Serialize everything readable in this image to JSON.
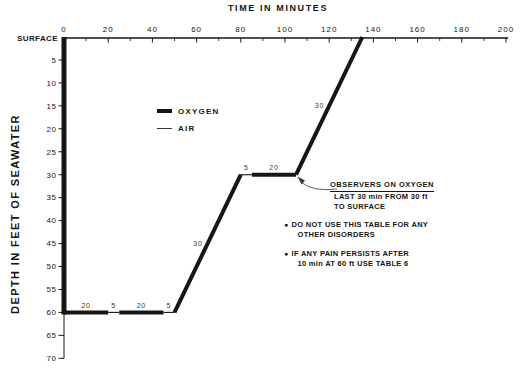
{
  "page": {
    "background": "#ffffff",
    "ink": "#161616",
    "muted_ink": "#3a3a3a"
  },
  "title": "TIME IN MINUTES",
  "y_axis_label": "DEPTH IN FEET OF SEAWATER",
  "legend": {
    "items": [
      {
        "label": "OXYGEN",
        "style": "oxygen"
      },
      {
        "label": "AIR",
        "style": "air"
      }
    ]
  },
  "callout": {
    "title": "OBSERVERS ON OXYGEN",
    "lines": [
      "LAST 30 min FROM 30 ft",
      "TO SURFACE"
    ]
  },
  "notes": {
    "bullet": "●",
    "items": [
      {
        "lines": [
          "DO NOT USE THIS TABLE FOR ANY",
          "OTHER DISORDERS"
        ]
      },
      {
        "lines": [
          "IF ANY PAIN PERSISTS AFTER",
          "10 min AT 60 ft USE TABLE 6"
        ]
      }
    ]
  },
  "chart_data": {
    "type": "line",
    "title": "TIME IN MINUTES",
    "xlabel": "TIME IN MINUTES",
    "ylabel": "DEPTH IN FEET OF SEAWATER",
    "xlim": [
      0,
      200
    ],
    "ylim": [
      0,
      70
    ],
    "y_axis_inverted": true,
    "grid": false,
    "legend_position": "upper-left-inside",
    "x_ticks": [
      0,
      20,
      40,
      60,
      80,
      100,
      120,
      140,
      160,
      180,
      200
    ],
    "x_minor_ticks": [
      10,
      30,
      50,
      70,
      90,
      110,
      130,
      150,
      170,
      190
    ],
    "y_ticks": [
      5,
      10,
      15,
      20,
      25,
      30,
      35,
      40,
      45,
      50,
      55,
      60,
      65,
      70
    ],
    "surface_label": "SURFACE",
    "series_names": [
      "OXYGEN",
      "AIR"
    ],
    "segments": [
      {
        "t0": 0,
        "d0": 0,
        "t1": 0,
        "d1": 60,
        "gas": "oxygen",
        "label": ""
      },
      {
        "t0": 0,
        "d0": 60,
        "t1": 20,
        "d1": 60,
        "gas": "oxygen",
        "label": "20"
      },
      {
        "t0": 20,
        "d0": 60,
        "t1": 25,
        "d1": 60,
        "gas": "air",
        "label": "5"
      },
      {
        "t0": 25,
        "d0": 60,
        "t1": 45,
        "d1": 60,
        "gas": "oxygen",
        "label": "20"
      },
      {
        "t0": 45,
        "d0": 60,
        "t1": 50,
        "d1": 60,
        "gas": "air",
        "label": "5"
      },
      {
        "t0": 50,
        "d0": 60,
        "t1": 80,
        "d1": 30,
        "gas": "oxygen",
        "label": "30"
      },
      {
        "t0": 80,
        "d0": 30,
        "t1": 85,
        "d1": 30,
        "gas": "air",
        "label": "5"
      },
      {
        "t0": 85,
        "d0": 30,
        "t1": 105,
        "d1": 30,
        "gas": "oxygen",
        "label": "20"
      },
      {
        "t0": 105,
        "d0": 30,
        "t1": 135,
        "d1": 0,
        "gas": "oxygen",
        "label": "30"
      }
    ]
  }
}
